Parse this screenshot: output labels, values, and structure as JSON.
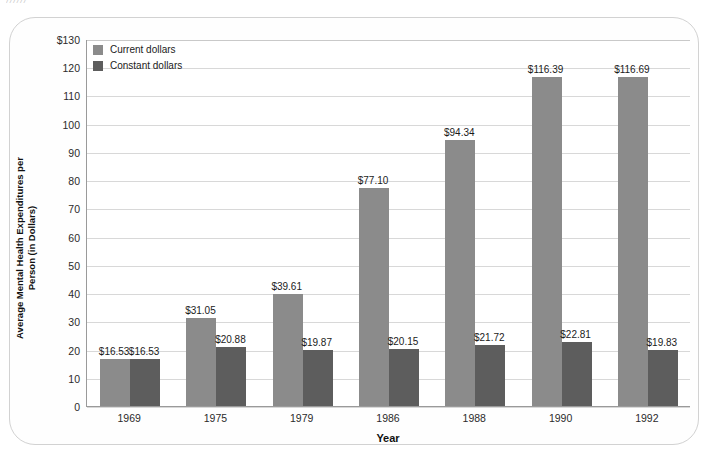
{
  "page": {
    "scan_artifact_text": "//////"
  },
  "legend": {
    "position": "top-left",
    "items": [
      {
        "label": "Current dollars",
        "color": "#8b8b8b",
        "swatch_name": "legend-swatch-current"
      },
      {
        "label": "Constant dollars",
        "color": "#5d5d5d",
        "swatch_name": "legend-swatch-constant"
      }
    ]
  },
  "axes": {
    "y_title": "Average Mental Health Expenditures per Person (in Dollars)",
    "x_title": "Year",
    "y_ticks": [
      "0",
      "10",
      "20",
      "30",
      "40",
      "50",
      "60",
      "70",
      "80",
      "90",
      "100",
      "110",
      "120",
      "$130"
    ]
  },
  "chart_data": {
    "type": "bar",
    "title": "",
    "xlabel": "Year",
    "ylabel": "Average Mental Health Expenditures per Person (in Dollars)",
    "ylim": [
      0,
      130
    ],
    "ytick_step": 10,
    "grid": true,
    "legend_position": "top-left",
    "categories": [
      "1969",
      "1975",
      "1979",
      "1986",
      "1988",
      "1990",
      "1992"
    ],
    "series": [
      {
        "name": "Current dollars",
        "color": "#8b8b8b",
        "values": [
          16.53,
          31.05,
          39.61,
          77.1,
          94.34,
          116.39,
          116.69
        ],
        "labels": [
          "$16.53",
          "$31.05",
          "$39.61",
          "$77.10",
          "$94.34",
          "$116.39",
          "$116.69"
        ]
      },
      {
        "name": "Constant dollars",
        "color": "#5d5d5d",
        "values": [
          16.53,
          20.88,
          19.87,
          20.15,
          21.72,
          22.81,
          19.83
        ],
        "labels": [
          "$16.53",
          "$20.88",
          "$19.87",
          "$20.15",
          "$21.72",
          "$22.81",
          "$19.83"
        ]
      }
    ]
  }
}
